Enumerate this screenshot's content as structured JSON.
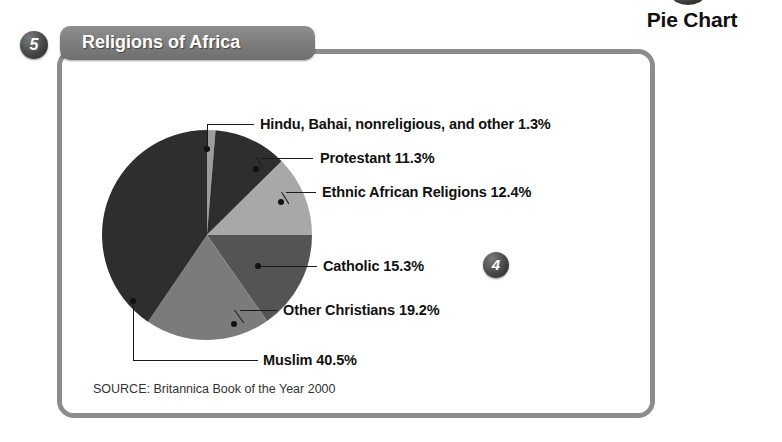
{
  "section": {
    "heading": "Pie Chart",
    "badge_top": ""
  },
  "panel": {
    "title": "Religions of Africa",
    "badge_step": "5",
    "badge_callout": "4",
    "source": "SOURCE: Britannica Book of the Year 2000"
  },
  "colors": {
    "frame": "#8c8c8c",
    "tab": "#7e7e7e",
    "text": "#111111",
    "slice_dark": "#2e2e2e",
    "slice_light": "#a8a8a8",
    "slice_mid": "#8a8a8a",
    "slice_mid_dark": "#545454",
    "slice_mid_gray": "#6e6e6e"
  },
  "chart_data": {
    "type": "pie",
    "title": "Religions of Africa",
    "source": "SOURCE: Britannica Book of the Year 2000",
    "unit": "%",
    "total": 100.0,
    "start_angle": 0,
    "direction": "clockwise",
    "legend": "labels-with-leader-lines",
    "categories": [
      "Hindu, Bahai, nonreligious, and other",
      "Protestant",
      "Ethnic African Religions",
      "Catholic",
      "Other Christians",
      "Muslim"
    ],
    "values": [
      1.3,
      11.3,
      12.4,
      15.3,
      19.2,
      40.5
    ],
    "slices": [
      {
        "label": "Hindu, Bahai, nonreligious, and other 1.3%",
        "name": "Hindu, Bahai, nonreligious, and other",
        "value": 1.3,
        "color": "#9d9d9d"
      },
      {
        "label": "Protestant 11.3%",
        "name": "Protestant",
        "value": 11.3,
        "color": "#2e2e2e"
      },
      {
        "label": "Ethnic African Religions 12.4%",
        "name": "Ethnic African Religions",
        "value": 12.4,
        "color": "#a8a8a8"
      },
      {
        "label": "Catholic 15.3%",
        "name": "Catholic",
        "value": 15.3,
        "color": "#545454"
      },
      {
        "label": "Other Christians 19.2%",
        "name": "Other Christians",
        "value": 19.2,
        "color": "#7b7b7b"
      },
      {
        "label": "Muslim 40.5%",
        "name": "Muslim",
        "value": 40.5,
        "color": "#2e2e2e"
      }
    ]
  }
}
